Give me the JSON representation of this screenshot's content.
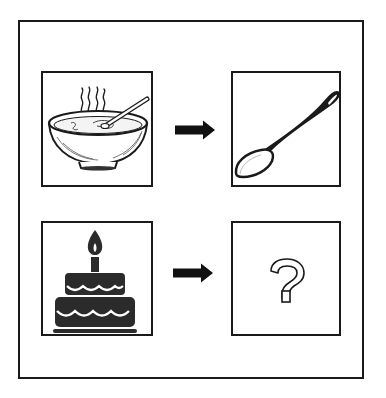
{
  "puzzle": {
    "type": "visual-analogy",
    "rows": [
      {
        "left": {
          "icon": "soup-bowl-icon",
          "label": "Soup bowl"
        },
        "connector": "right-arrow-icon",
        "right": {
          "icon": "spoon-icon",
          "label": "Spoon"
        }
      },
      {
        "left": {
          "icon": "birthday-cake-icon",
          "label": "Birthday cake"
        },
        "connector": "right-arrow-icon",
        "right": {
          "icon": "question-mark-icon",
          "label": "?"
        }
      }
    ]
  },
  "colors": {
    "ink": "#1a1a1a",
    "cake_fill": "#2b2b2b",
    "background": "#ffffff"
  }
}
